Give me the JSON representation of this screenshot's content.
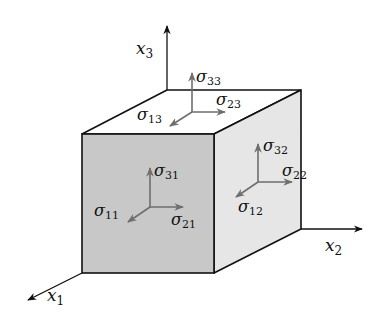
{
  "diagram": {
    "type": "stress-tensor-cube",
    "axes": [
      {
        "id": "x1",
        "symbol": "x",
        "subscript": "1"
      },
      {
        "id": "x2",
        "symbol": "x",
        "subscript": "2"
      },
      {
        "id": "x3",
        "symbol": "x",
        "subscript": "3"
      }
    ],
    "faces": {
      "front": {
        "label_normal": {
          "symbol": "σ",
          "subscript": "11"
        },
        "label_horizontal": {
          "symbol": "σ",
          "subscript": "21"
        },
        "label_vertical": {
          "symbol": "σ",
          "subscript": "31"
        }
      },
      "right": {
        "label_normal": {
          "symbol": "σ",
          "subscript": "22"
        },
        "label_depth": {
          "symbol": "σ",
          "subscript": "12"
        },
        "label_vertical": {
          "symbol": "σ",
          "subscript": "32"
        }
      },
      "top": {
        "label_normal": {
          "symbol": "σ",
          "subscript": "33"
        },
        "label_horizontal": {
          "symbol": "σ",
          "subscript": "23"
        },
        "label_depth": {
          "symbol": "σ",
          "subscript": "13"
        }
      }
    },
    "colors": {
      "edge": "#111111",
      "front_face": "#c8c8c8",
      "right_face": "#e6e6e6",
      "top_face": "#ffffff",
      "stress_arrow": "#6e6e6e",
      "axis": "#111111"
    }
  }
}
